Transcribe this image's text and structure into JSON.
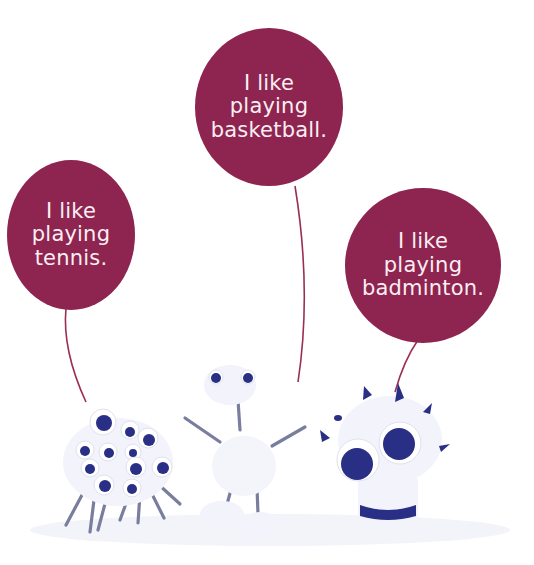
{
  "colors": {
    "bubble": "#8e2450",
    "string": "#9a2f55",
    "text": "#fbeef2",
    "figure_blue": "#2a2f86",
    "figure_white": "#f2f3fb",
    "screw": "#7a7e9e"
  },
  "bubbles": [
    {
      "id": "tennis",
      "lines": [
        "I like",
        "playing",
        "tennis."
      ]
    },
    {
      "id": "basketball",
      "lines": [
        "I like",
        "playing",
        "basketball."
      ]
    },
    {
      "id": "badminton",
      "lines": [
        "I like",
        "playing",
        "badminton."
      ]
    }
  ],
  "figures": [
    {
      "id": "many-eyed-monster",
      "description": "white clay blob covered in googly eyes with screw legs"
    },
    {
      "id": "stick-figure-monster",
      "description": "white clay figure with two eyes, screw arms and legs"
    },
    {
      "id": "spiky-monster",
      "description": "white clay monster with two big eyes, blue spikes and a blue stripe"
    }
  ]
}
